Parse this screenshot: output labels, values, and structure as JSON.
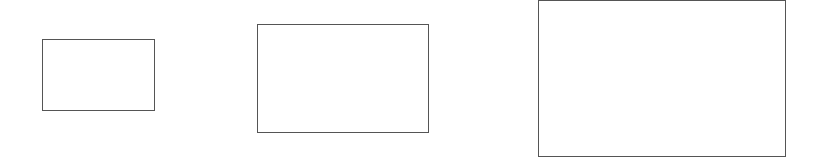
{
  "canvas": {
    "width": 825,
    "height": 165,
    "background": "#ffffff"
  },
  "stroke_color": "#555555",
  "rectangles": [
    {
      "id": "small",
      "x": 42,
      "y": 39,
      "width": 113,
      "height": 72
    },
    {
      "id": "medium",
      "x": 257,
      "y": 24,
      "width": 172,
      "height": 109
    },
    {
      "id": "large",
      "x": 538,
      "y": 0,
      "width": 248,
      "height": 157
    }
  ]
}
